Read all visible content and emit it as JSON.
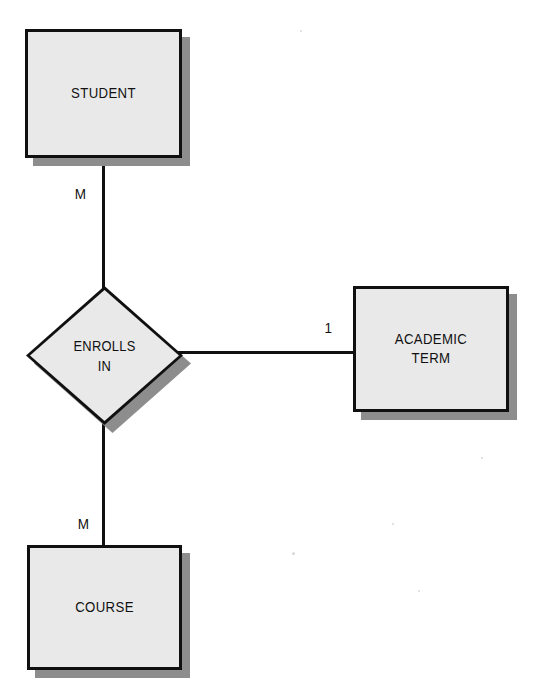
{
  "diagram": {
    "background_color": "#ffffff",
    "fill_color": "#e9e9e9",
    "line_color": "#101010",
    "shadow_color": "#8d8d8d",
    "entities": [
      {
        "id": "student",
        "label": "STUDENT",
        "shape": "rectangle"
      },
      {
        "id": "course",
        "label": "COURSE",
        "shape": "rectangle"
      },
      {
        "id": "academic_term",
        "label": "ACADEMIC\nTERM",
        "shape": "rectangle"
      }
    ],
    "relationships": [
      {
        "id": "enrolls_in",
        "label": "ENROLLS\nIN",
        "shape": "diamond"
      }
    ],
    "connections": [
      {
        "id": "student-enrolls",
        "from": "student",
        "to": "enrolls_in",
        "cardinality": "M"
      },
      {
        "id": "course-enrolls",
        "from": "course",
        "to": "enrolls_in",
        "cardinality": "M"
      },
      {
        "id": "term-enrolls",
        "from": "enrolls_in",
        "to": "academic_term",
        "cardinality": "1"
      }
    ]
  }
}
